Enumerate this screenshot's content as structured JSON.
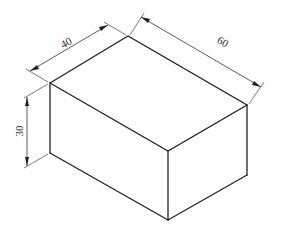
{
  "diagram": {
    "type": "isometric-box-with-dimensions",
    "colors": {
      "background": "#ffffff",
      "edge": "#222222",
      "dimension": "#333333"
    },
    "dimensions": {
      "depth": {
        "label": "40"
      },
      "length": {
        "label": "60"
      },
      "height": {
        "label": "30"
      }
    }
  }
}
